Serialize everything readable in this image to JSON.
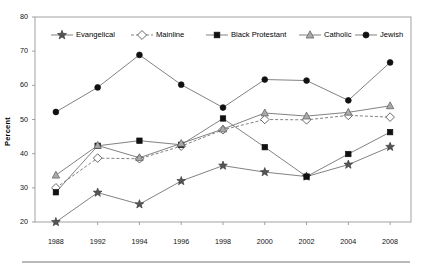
{
  "chart_data": {
    "type": "line",
    "title": "",
    "xlabel": "",
    "ylabel": "Percent",
    "categories": [
      "1988",
      "1992",
      "1994",
      "1996",
      "1998",
      "2000",
      "2002",
      "2004",
      "2008"
    ],
    "ylim": [
      20,
      80
    ],
    "yticks": [
      "20",
      "30",
      "40",
      "50",
      "60",
      "70",
      "80"
    ],
    "grid": false,
    "legend_position": "top-inside",
    "series": [
      {
        "name": "Evangelical",
        "marker": "star",
        "color": "#555555",
        "line": "solid",
        "values": [
          20.0,
          28.6,
          25.2,
          32.0,
          36.5,
          34.6,
          33.3,
          36.8,
          42.0
        ]
      },
      {
        "name": "Mainline",
        "marker": "diamond",
        "color": "#ffffff",
        "line": "dashed",
        "values": [
          30.0,
          38.7,
          38.5,
          42.2,
          47.0,
          50.0,
          49.9,
          51.2,
          50.7
        ]
      },
      {
        "name": "Black Protestant",
        "marker": "square",
        "color": "#111111",
        "line": "solid",
        "values": [
          28.7,
          42.3,
          43.8,
          42.6,
          50.3,
          41.9,
          33.3,
          39.9,
          46.3
        ]
      },
      {
        "name": "Catholic",
        "marker": "triangle",
        "color": "#aaaaaa",
        "line": "solid",
        "values": [
          33.7,
          42.4,
          38.8,
          43.0,
          47.2,
          51.9,
          51.0,
          52.1,
          54.0
        ]
      },
      {
        "name": "Jewish",
        "marker": "circle",
        "color": "#111111",
        "line": "solid",
        "values": [
          52.2,
          59.4,
          68.9,
          60.2,
          53.5,
          61.7,
          61.4,
          55.6,
          66.7
        ]
      }
    ]
  },
  "legend": {
    "items": [
      {
        "label": "Evangelical"
      },
      {
        "label": "Mainline"
      },
      {
        "label": "Black Protestant"
      },
      {
        "label": "Catholic"
      },
      {
        "label": "Jewish"
      }
    ]
  }
}
